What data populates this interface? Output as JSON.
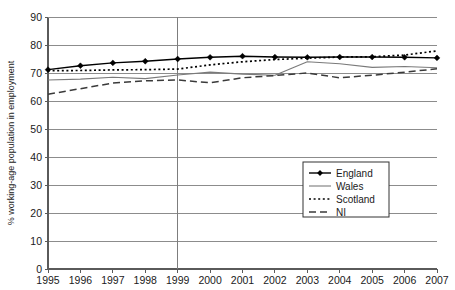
{
  "chart_data": {
    "type": "line",
    "title": "",
    "xlabel": "",
    "ylabel": "% working-age population in employment",
    "categories": [
      "1995",
      "1996",
      "1997",
      "1998",
      "1999",
      "2000",
      "2001",
      "2002",
      "2003",
      "2004",
      "2005",
      "2006",
      "2007"
    ],
    "x": [
      1995,
      1996,
      1997,
      1998,
      1999,
      2000,
      2001,
      2002,
      2003,
      2004,
      2005,
      2006,
      2007
    ],
    "xlim": [
      1995,
      2007
    ],
    "ylim": [
      0,
      90
    ],
    "yticks": [
      0,
      10,
      20,
      30,
      40,
      50,
      60,
      70,
      80,
      90
    ],
    "grid": true,
    "legend_position": "lower-right-inside",
    "annotations": [
      {
        "type": "vertical-reference-line",
        "x": 1999,
        "label": "1999"
      }
    ],
    "series": [
      {
        "name": "England",
        "style": "solid-with-diamond-markers",
        "color": "#000000",
        "values": [
          71.2,
          72.6,
          73.6,
          74.2,
          75.0,
          75.6,
          76.0,
          75.7,
          75.6,
          75.7,
          75.7,
          75.6,
          75.4
        ]
      },
      {
        "name": "Wales",
        "style": "solid-thin",
        "color": "#7a7a7a",
        "values": [
          67.5,
          67.8,
          68.5,
          68.0,
          69.3,
          70.3,
          69.6,
          69.2,
          74.0,
          73.3,
          72.0,
          72.3,
          71.9
        ]
      },
      {
        "name": "Scotland",
        "style": "dotted",
        "color": "#000000",
        "values": [
          70.8,
          70.9,
          71.1,
          71.2,
          71.4,
          72.9,
          74.0,
          74.8,
          75.3,
          75.7,
          75.8,
          76.4,
          77.9
        ]
      },
      {
        "name": "NI",
        "style": "dashed",
        "color": "#3a3a3a",
        "values": [
          62.4,
          64.4,
          66.4,
          67.2,
          67.5,
          66.5,
          68.3,
          69.1,
          70.0,
          68.3,
          69.2,
          70.3,
          71.5
        ]
      }
    ]
  },
  "axis": {
    "ylabel": "% working-age population in employment",
    "ytick_labels": [
      "90",
      "80",
      "70",
      "60",
      "50",
      "40",
      "30",
      "20",
      "10",
      "0"
    ],
    "xtick_labels": [
      "1995",
      "1996",
      "1997",
      "1998",
      "1999",
      "2000",
      "2001",
      "2002",
      "2003",
      "2004",
      "2005",
      "2006",
      "2007"
    ]
  },
  "legend": {
    "items": [
      {
        "label": "England",
        "marker": "diamond-marker",
        "style": "solid"
      },
      {
        "label": "Wales",
        "marker": "none",
        "style": "solid"
      },
      {
        "label": "Scotland",
        "marker": "none",
        "style": "dotted"
      },
      {
        "label": "NI",
        "marker": "none",
        "style": "dashed"
      }
    ]
  },
  "colors": {
    "england": "#000000",
    "wales": "#7a7a7a",
    "scotland": "#000000",
    "ni": "#3a3a3a",
    "grid": "#8c8c8c",
    "axis": "#5a5a5a"
  }
}
